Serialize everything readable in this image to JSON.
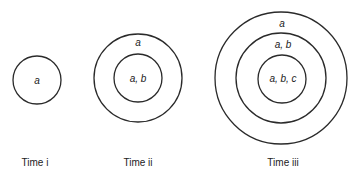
{
  "diagram": {
    "type": "nested-circles",
    "stroke_color": "#2a2a2a",
    "groups": [
      {
        "caption": "Time i",
        "rings": [
          {
            "label": "a"
          }
        ]
      },
      {
        "caption": "Time ii",
        "rings": [
          {
            "label": "a"
          },
          {
            "label": "a, b"
          }
        ]
      },
      {
        "caption": "Time iii",
        "rings": [
          {
            "label": "a"
          },
          {
            "label": "a, b"
          },
          {
            "label": "a, b, c"
          }
        ]
      }
    ]
  }
}
